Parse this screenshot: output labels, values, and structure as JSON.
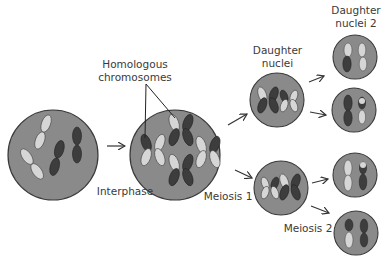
{
  "diagram": {
    "title": "Meiosis",
    "colors": {
      "cell_fill": "#8a8a8a",
      "cell_stroke": "#3a3a3a",
      "chrom_dark": "#3d3d3d",
      "chrom_light": "#d6d6d6",
      "arrow": "#333333",
      "text": "#3a3a3a"
    },
    "labels": {
      "homologous_line1": "Homologous",
      "homologous_line2": "chromosomes",
      "interphase": "Interphase",
      "meiosis1": "Meiosis 1",
      "meiosis2": "Meiosis 2",
      "daughter_line1": "Daughter",
      "daughter_line2": "nuclei",
      "daughter2_line1": "Daughter",
      "daughter2_line2": "nuclei 2"
    },
    "stages": [
      {
        "id": "parent-cell",
        "description": "Cell with 4 unreplicated chromosomes (2 light, 2 dark)"
      },
      {
        "id": "interphase-cell",
        "description": "Cell with 4 replicated chromosomes (X-shaped)"
      },
      {
        "id": "daughter-nuclei",
        "count": 2,
        "description": "Two cells after Meiosis 1, each with 2 replicated chromosomes"
      },
      {
        "id": "daughter-nuclei-2",
        "count": 4,
        "description": "Four cells after Meiosis 2, each with 2 single chromatids"
      }
    ]
  }
}
